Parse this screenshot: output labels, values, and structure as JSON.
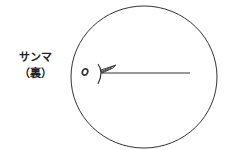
{
  "label": {
    "line1": "サンマ",
    "line2": "（裏）"
  },
  "diagram": {
    "stroke_color": "#333333"
  }
}
